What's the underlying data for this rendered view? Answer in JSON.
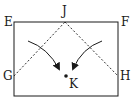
{
  "diagram": {
    "type": "geometry-folding",
    "labels": {
      "E": "E",
      "F": "F",
      "G": "G",
      "H": "H",
      "J": "J",
      "K": "K"
    },
    "points": {
      "E": [
        14,
        22
      ],
      "F": [
        118,
        22
      ],
      "J": [
        65,
        22
      ],
      "G": [
        14,
        76
      ],
      "H": [
        118,
        76
      ],
      "K": [
        66,
        76
      ]
    },
    "rectangle": {
      "x": 14,
      "y": 22,
      "width": 104,
      "height": 74
    },
    "dashed_lines": [
      [
        "G",
        "J"
      ],
      [
        "J",
        "H"
      ]
    ],
    "arrows": [
      {
        "from": [
          28,
          41
        ],
        "to": [
          59,
          69
        ],
        "direction": "fold-left-corner-to-K"
      },
      {
        "from": [
          102,
          41
        ],
        "to": [
          73,
          69
        ],
        "direction": "fold-right-corner-to-K"
      }
    ],
    "colors": {
      "stroke": "#1a1a1a",
      "background": "#ffffff"
    }
  }
}
